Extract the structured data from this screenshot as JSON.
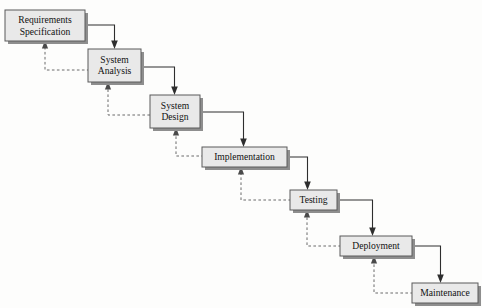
{
  "diagram": {
    "type": "flowchart",
    "canvas": {
      "width": 482,
      "height": 308,
      "background": "#fdfdfc"
    },
    "style": {
      "node_fill": "#e9e9e9",
      "node_border": "#5a5a5a",
      "node_shadow": "#8e8e8e",
      "flow_arrow_color": "#2e2e2e",
      "feedback_arrow_color": "#6a6a6a",
      "text_color": "#111111"
    },
    "nodes": [
      {
        "id": "requirements-specification",
        "lines": [
          "Requirements",
          "Specification"
        ],
        "x": 5,
        "y": 10,
        "w": 80,
        "h": 31
      },
      {
        "id": "system-analysis",
        "lines": [
          "System",
          "Analysis"
        ],
        "x": 88,
        "y": 49,
        "w": 53,
        "h": 33
      },
      {
        "id": "system-design",
        "lines": [
          "System",
          "Design"
        ],
        "x": 150,
        "y": 95,
        "w": 50,
        "h": 33
      },
      {
        "id": "implementation",
        "lines": [
          "Implementation"
        ],
        "x": 202,
        "y": 147,
        "w": 85,
        "h": 20
      },
      {
        "id": "testing",
        "lines": [
          "Testing"
        ],
        "x": 290,
        "y": 190,
        "w": 47,
        "h": 20
      },
      {
        "id": "deployment",
        "lines": [
          "Deployment"
        ],
        "x": 340,
        "y": 236,
        "w": 72,
        "h": 20
      },
      {
        "id": "maintenance",
        "lines": [
          "Maintenance"
        ],
        "x": 412,
        "y": 283,
        "w": 66,
        "h": 20
      }
    ],
    "flow_edges": [
      {
        "from": "requirements-specification",
        "to": "system-analysis",
        "style": "solid",
        "direction": "forward"
      },
      {
        "from": "system-analysis",
        "to": "system-design",
        "style": "solid",
        "direction": "forward"
      },
      {
        "from": "system-design",
        "to": "implementation",
        "style": "solid",
        "direction": "forward"
      },
      {
        "from": "implementation",
        "to": "testing",
        "style": "solid",
        "direction": "forward"
      },
      {
        "from": "testing",
        "to": "deployment",
        "style": "solid",
        "direction": "forward"
      },
      {
        "from": "deployment",
        "to": "maintenance",
        "style": "solid",
        "direction": "forward"
      }
    ],
    "feedback_edges": [
      {
        "from": "system-analysis",
        "to": "requirements-specification",
        "style": "dashed",
        "direction": "backward"
      },
      {
        "from": "system-design",
        "to": "system-analysis",
        "style": "dashed",
        "direction": "backward"
      },
      {
        "from": "implementation",
        "to": "system-design",
        "style": "dashed",
        "direction": "backward"
      },
      {
        "from": "testing",
        "to": "implementation",
        "style": "dashed",
        "direction": "backward"
      },
      {
        "from": "deployment",
        "to": "testing",
        "style": "dashed",
        "direction": "backward"
      },
      {
        "from": "maintenance",
        "to": "deployment",
        "style": "dashed",
        "direction": "backward"
      }
    ]
  }
}
